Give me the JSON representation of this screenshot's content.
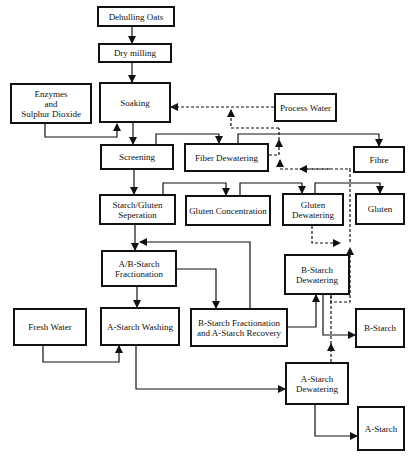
{
  "diagram": {
    "type": "process-flowchart",
    "colors": {
      "line": "#111111",
      "background": "#ffffff"
    },
    "nodes": {
      "dehulling_oats": {
        "label": "Dehulling Oats"
      },
      "dry_milling": {
        "label": "Dry milling"
      },
      "enzymes": {
        "label": "Enzymes\nand\nSulphur Dioxide"
      },
      "soaking": {
        "label": "Soaking"
      },
      "process_water": {
        "label": "Process Water"
      },
      "screening": {
        "label": "Screening"
      },
      "fiber_dewatering": {
        "label": "Fiber Dewatering"
      },
      "fibre": {
        "label": "Fibre"
      },
      "starch_gluten_separation": {
        "label": "Starch/Gluten\nSeperation"
      },
      "gluten_concentration": {
        "label": "Gluten Concentration"
      },
      "gluten_dewatering": {
        "label": "Gluten\nDewatering"
      },
      "gluten": {
        "label": "Gluten"
      },
      "ab_starch_fractionation": {
        "label": "A/B-Starch\nFractionation"
      },
      "b_starch_dewatering": {
        "label": "B-Starch\nDewatering"
      },
      "fresh_water": {
        "label": "Fresh Water"
      },
      "a_starch_washing": {
        "label": "A-Starch Washing"
      },
      "b_starch_fractionation_recovery": {
        "label": "B-Starch Fractionation\nand A-Starch Recovery"
      },
      "b_starch": {
        "label": "B-Starch"
      },
      "a_starch_dewatering": {
        "label": "A-Starch\nDewatering"
      },
      "a_starch": {
        "label": "A-Starch"
      }
    },
    "edges": [
      {
        "from": "Dehulling Oats",
        "to": "Dry milling",
        "style": "solid"
      },
      {
        "from": "Dry milling",
        "to": "Soaking",
        "style": "solid"
      },
      {
        "from": "Enzymes and Sulphur Dioxide",
        "to": "Soaking",
        "style": "solid"
      },
      {
        "from": "Process Water",
        "to": "Soaking",
        "style": "dashed"
      },
      {
        "from": "Soaking",
        "to": "Screening",
        "style": "solid"
      },
      {
        "from": "Screening",
        "to": "Fiber Dewatering",
        "style": "solid"
      },
      {
        "from": "Fiber Dewatering",
        "to": "Fibre",
        "style": "solid"
      },
      {
        "from": "Fiber Dewatering",
        "to": "Soaking (water recycle)",
        "style": "dashed"
      },
      {
        "from": "Screening",
        "to": "Starch/Gluten Seperation",
        "style": "solid"
      },
      {
        "from": "Starch/Gluten Seperation",
        "to": "Gluten Concentration",
        "style": "solid"
      },
      {
        "from": "Gluten Concentration",
        "to": "Gluten Dewatering",
        "style": "solid"
      },
      {
        "from": "Gluten Dewatering",
        "to": "Gluten",
        "style": "solid"
      },
      {
        "from": "Gluten Dewatering",
        "to": "water recycle",
        "style": "dashed"
      },
      {
        "from": "Starch/Gluten Seperation",
        "to": "A/B-Starch Fractionation",
        "style": "solid"
      },
      {
        "from": "B-Starch Fractionation and A-Starch Recovery",
        "to": "A/B-Starch Fractionation",
        "style": "solid"
      },
      {
        "from": "A/B-Starch Fractionation",
        "to": "A-Starch Washing",
        "style": "solid"
      },
      {
        "from": "A/B-Starch Fractionation",
        "to": "B-Starch Fractionation and A-Starch Recovery",
        "style": "solid"
      },
      {
        "from": "Fresh Water",
        "to": "A-Starch Washing",
        "style": "solid"
      },
      {
        "from": "B-Starch Fractionation and A-Starch Recovery",
        "to": "B-Starch Dewatering",
        "style": "solid"
      },
      {
        "from": "B-Starch Dewatering",
        "to": "B-Starch",
        "style": "solid"
      },
      {
        "from": "B-Starch Dewatering",
        "to": "water recycle",
        "style": "dashed"
      },
      {
        "from": "A-Starch Washing",
        "to": "A-Starch Dewatering",
        "style": "solid"
      },
      {
        "from": "A-Starch Dewatering",
        "to": "water recycle",
        "style": "dashed"
      },
      {
        "from": "A-Starch Dewatering",
        "to": "A-Starch",
        "style": "solid"
      }
    ]
  }
}
